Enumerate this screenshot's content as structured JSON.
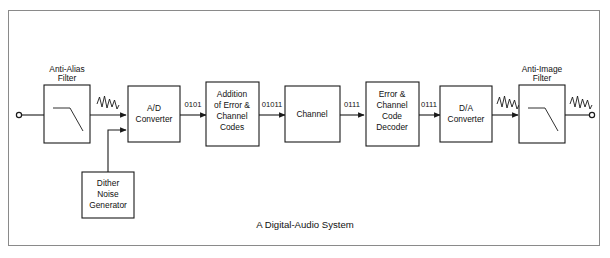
{
  "figure": {
    "caption": "A Digital-Audio System",
    "border_color": "#8a8a8a",
    "line_color": "#1a1a1a",
    "background": "#ffffff"
  },
  "blocks": [
    {
      "id": "anti_alias_filter",
      "top_label_line1": "Anti-Alias",
      "top_label_line2": "Filter",
      "symbol": "lowpass-curve"
    },
    {
      "id": "ad_converter",
      "line1": "A/D",
      "line2": "Converter"
    },
    {
      "id": "addition_codes",
      "line1": "Addition",
      "line2": "of Error &",
      "line3": "Channel",
      "line4": "Codes"
    },
    {
      "id": "channel",
      "line1": "Channel"
    },
    {
      "id": "decoder",
      "line1": "Error &",
      "line2": "Channel",
      "line3": "Code",
      "line4": "Decoder"
    },
    {
      "id": "da_converter",
      "line1": "D/A",
      "line2": "Converter"
    },
    {
      "id": "anti_image_filter",
      "top_label_line1": "Anti-Image",
      "top_label_line2": "Filter",
      "symbol": "lowpass-curve"
    },
    {
      "id": "dither_noise_generator",
      "line1": "Dither",
      "line2": "Noise",
      "line3": "Generator"
    }
  ],
  "signal_labels": {
    "ad_out": "0101",
    "codes_out": "01011",
    "channel_out": "0111",
    "decoder_out": "0111"
  },
  "analog_markers": {
    "input_wave": "analog-waveform",
    "filter_out_wave": "analog-waveform",
    "da_out_wave": "analog-waveform",
    "output_wave": "analog-waveform"
  },
  "terminals": {
    "input": "input-terminal",
    "output": "output-terminal"
  }
}
